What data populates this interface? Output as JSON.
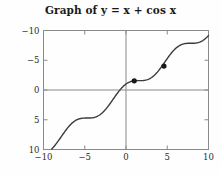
{
  "chart_data": {
    "type": "line",
    "title": "Graph of y = x + cos x",
    "title_plain": "Graph of y = x + cos x",
    "function": "y = x + cos x",
    "xlabel": "",
    "ylabel": "",
    "xlim": [
      -10,
      10
    ],
    "ylim": [
      -10,
      10
    ],
    "xticks": [
      -10,
      -5,
      0,
      5,
      10
    ],
    "yticks": [
      -10,
      -5,
      0,
      5,
      10
    ],
    "xtick_labels": [
      "−10",
      "−5",
      "0",
      "5",
      "10"
    ],
    "ytick_labels": [
      "10",
      "5",
      "0",
      "−5",
      "−10"
    ],
    "grid": false,
    "legend": null,
    "axes_style": "box-with-interior-axes",
    "line_color": "#3b3b3b",
    "axis_color": "#8a8a8a",
    "frame_color": "#8a8a8a",
    "marker_color": "#1a1a1a",
    "background": "#fefefe",
    "series": [
      {
        "name": "y = x + cos x",
        "x": [
          -10,
          -9.5,
          -9,
          -8.5,
          -8,
          -7.5,
          -7,
          -6.5,
          -6,
          -5.5,
          -5,
          -4.5,
          -4,
          -3.5,
          -3,
          -2.5,
          -2,
          -1.5,
          -1,
          -0.5,
          0,
          0.5,
          1,
          1.5,
          2,
          2.5,
          3,
          3.5,
          4,
          4.5,
          5,
          5.5,
          6,
          6.5,
          7,
          7.5,
          8,
          8.5,
          9,
          9.5,
          10
        ],
        "y": [
          -9.161,
          -9.711,
          -9.911,
          -9.898,
          -9.854,
          -9.654,
          -6.246,
          -7.477,
          -5.04,
          -4.793,
          -4.716,
          -4.289,
          -4.654,
          -3.564,
          -3.99,
          -3.301,
          -2.416,
          -1.429,
          -0.46,
          0.378,
          1.0,
          1.378,
          1.54,
          1.571,
          1.584,
          1.699,
          2.01,
          2.564,
          3.346,
          4.289,
          5.284,
          6.209,
          6.96,
          7.477,
          7.754,
          7.854,
          7.854,
          7.92,
          8.089,
          8.48,
          9.161
        ]
      }
    ],
    "markers": [
      {
        "x": 1.0,
        "y": 1.54,
        "label": ""
      },
      {
        "x": 4.6,
        "y": 4.02,
        "label": ""
      }
    ]
  }
}
